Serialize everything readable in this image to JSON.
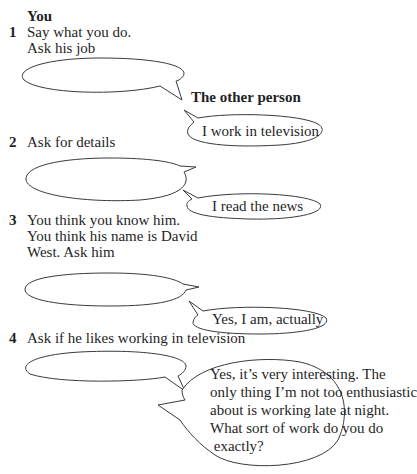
{
  "headers": {
    "you": "You",
    "other_person": "The other person"
  },
  "items": [
    {
      "number": "1",
      "instructions": [
        "Say what you do.",
        "Ask his job"
      ],
      "reply": "I work in television"
    },
    {
      "number": "2",
      "instructions": [
        "Ask for details"
      ],
      "reply": "I read the news"
    },
    {
      "number": "3",
      "instructions": [
        "You think you know him.",
        "You think his name is David",
        "West. Ask him"
      ],
      "reply": "Yes, I am, actually"
    },
    {
      "number": "4",
      "instructions": [
        "Ask if he likes working in television"
      ],
      "reply_lines": [
        "Yes, it’s very interesting. The",
        "only thing I’m not too enthusiastic",
        "about is working late at night.",
        "What sort of work do you do",
        " exactly?"
      ]
    }
  ],
  "colors": {
    "text": "#1f1f1f",
    "bubble_stroke": "#3a3a3a",
    "background": "#ffffff"
  }
}
